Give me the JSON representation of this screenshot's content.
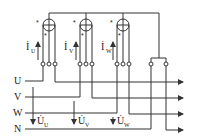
{
  "diagram": {
    "type": "three-phase-four-wire-energy-meter-wiring",
    "buses": [
      {
        "label": "U",
        "y": 81
      },
      {
        "label": "V",
        "y": 97
      },
      {
        "label": "W",
        "y": 113
      },
      {
        "label": "N",
        "y": 129
      }
    ],
    "meters": [
      {
        "id": "U",
        "cx": 49,
        "current_label": "İ",
        "current_sub": "U",
        "terminals": [
          43,
          49,
          55
        ]
      },
      {
        "id": "V",
        "cx": 86,
        "current_label": "İ",
        "current_sub": "V",
        "terminals": [
          80,
          86,
          92
        ]
      },
      {
        "id": "W",
        "cx": 123,
        "current_label": "İ",
        "current_sub": "W",
        "terminals": [
          117,
          123,
          129
        ]
      }
    ],
    "voltages": [
      {
        "label": "U̇",
        "sub": "U",
        "x": 33
      },
      {
        "label": "U̇",
        "sub": "V",
        "x": 74
      },
      {
        "label": "U̇",
        "sub": "W",
        "x": 111
      }
    ],
    "neutral_terminals": [
      151,
      166
    ],
    "polarity_mark": "*",
    "line_color": "#333333"
  }
}
